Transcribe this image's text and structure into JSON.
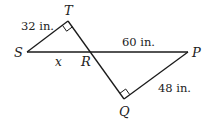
{
  "diagram": {
    "type": "geometry",
    "points": {
      "S": {
        "label": "S",
        "x": 27,
        "y": 52
      },
      "T": {
        "label": "T",
        "x": 68,
        "y": 21
      },
      "R": {
        "label": "R",
        "x": 91,
        "y": 52
      },
      "P": {
        "label": "P",
        "x": 188,
        "y": 52
      },
      "Q": {
        "label": "Q",
        "x": 124,
        "y": 99
      }
    },
    "measurements": {
      "ST": "32 in.",
      "SR": "x",
      "RP": "60 in.",
      "PQ": "48 in."
    },
    "right_angles": [
      "T",
      "Q"
    ],
    "colors": {
      "line": "#1a1a1a",
      "text": "#222222",
      "background": "#ffffff"
    }
  }
}
